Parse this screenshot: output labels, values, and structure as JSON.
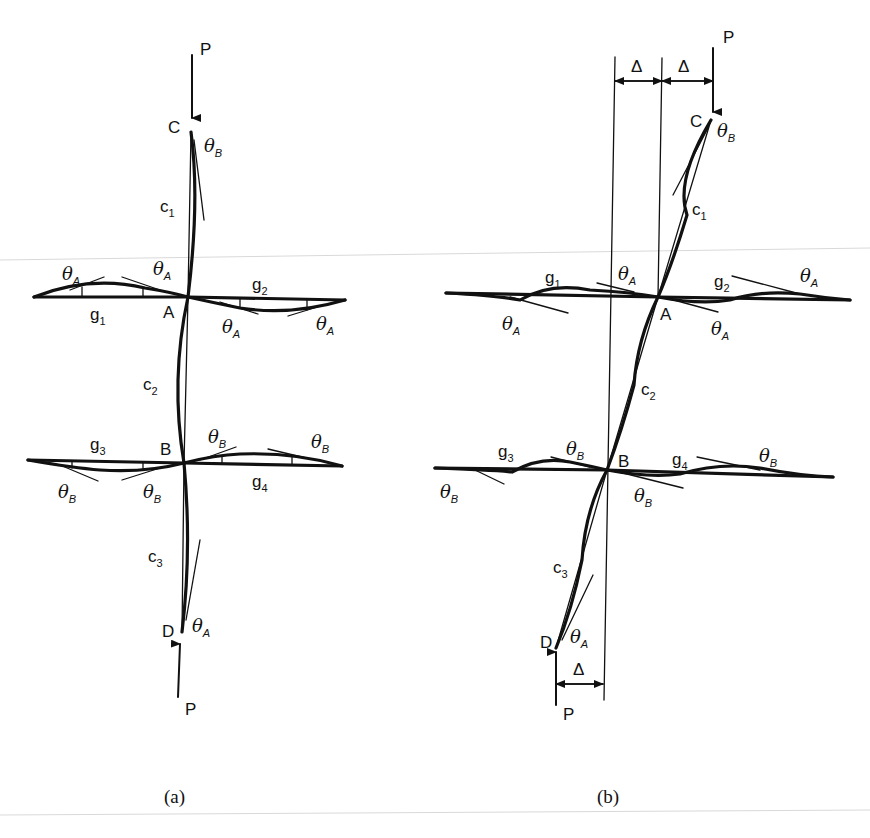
{
  "figure": {
    "a": {
      "caption": "(a)",
      "load_top": "P",
      "load_bottom": "P",
      "nodes": {
        "C": "C",
        "A": "A",
        "B": "B",
        "D": "D"
      },
      "members": {
        "c1": {
          "base": "c",
          "sub": "1"
        },
        "c2": {
          "base": "c",
          "sub": "2"
        },
        "c3": {
          "base": "c",
          "sub": "3"
        },
        "g1": {
          "base": "g",
          "sub": "1"
        },
        "g2": {
          "base": "g",
          "sub": "2"
        },
        "g3": {
          "base": "g",
          "sub": "3"
        },
        "g4": {
          "base": "g",
          "sub": "4"
        }
      },
      "rotations": {
        "thetaA": {
          "base": "θ",
          "sub": "A"
        },
        "thetaB": {
          "base": "θ",
          "sub": "B"
        }
      }
    },
    "b": {
      "caption": "(b)",
      "load_top": "P",
      "load_bottom": "P",
      "delta": "Δ",
      "nodes": {
        "C": "C",
        "A": "A",
        "B": "B",
        "D": "D"
      },
      "members": {
        "c1": {
          "base": "c",
          "sub": "1"
        },
        "c2": {
          "base": "c",
          "sub": "2"
        },
        "c3": {
          "base": "c",
          "sub": "3"
        },
        "g1": {
          "base": "g",
          "sub": "1"
        },
        "g2": {
          "base": "g",
          "sub": "2"
        },
        "g3": {
          "base": "g",
          "sub": "3"
        },
        "g4": {
          "base": "g",
          "sub": "4"
        }
      },
      "rotations": {
        "thetaA": {
          "base": "θ",
          "sub": "A"
        },
        "thetaB": {
          "base": "θ",
          "sub": "B"
        }
      }
    }
  }
}
